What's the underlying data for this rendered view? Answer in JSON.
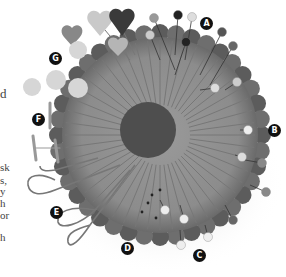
{
  "image": {
    "subject": "knitted pincushion with assorted pins",
    "palette": {
      "background": "#ffffff",
      "cushion": "#8a8a8a",
      "cushion_dark": "#5e5e5e",
      "center": "#4a4a4a",
      "label_bg": "#111111",
      "label_fg": "#ffffff"
    }
  },
  "labels": [
    "A",
    "B",
    "C",
    "D",
    "E",
    "F",
    "G"
  ],
  "left_text_fragments": [
    "d",
    "sk",
    "s,",
    "y",
    "h",
    "or",
    "h"
  ]
}
